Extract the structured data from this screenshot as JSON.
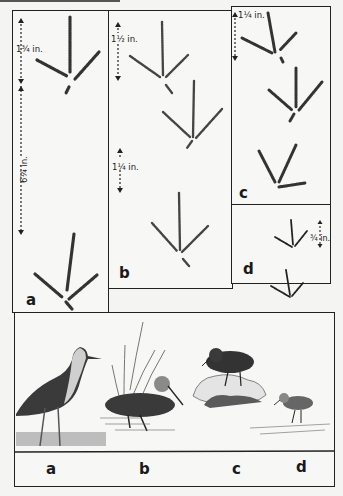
{
  "figure": {
    "panels": [
      {
        "id": "a",
        "label": "a",
        "measurements": [
          "1¾ in.",
          "6¼ in."
        ]
      },
      {
        "id": "b",
        "label": "b",
        "measurements": [
          "1½ in.",
          "1¼ in."
        ]
      },
      {
        "id": "c",
        "label": "c",
        "measurements": [
          "1¼ in."
        ]
      },
      {
        "id": "d",
        "label": "d",
        "measurements": [
          "¾ in."
        ]
      }
    ],
    "bird_labels": [
      "a",
      "b",
      "c",
      "d"
    ]
  },
  "colors": {
    "ink": "#1a1a1a",
    "paper": "#f4f4f2"
  }
}
